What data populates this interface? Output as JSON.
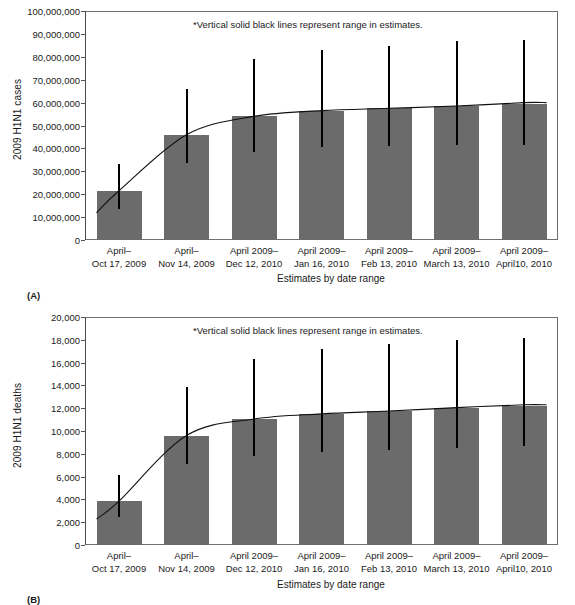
{
  "chart_data": [
    {
      "type": "bar",
      "panel": "(A)",
      "title": "",
      "xlabel": "Estimates by date range",
      "ylabel": "2009 H1N1 cases",
      "annotation": "*Vertical solid black lines represent range in estimates.",
      "ylim": [
        0,
        100000000
      ],
      "ytick_values": [
        0,
        10000000,
        20000000,
        30000000,
        40000000,
        50000000,
        60000000,
        70000000,
        80000000,
        90000000,
        100000000
      ],
      "ytick_labels": [
        "0",
        "10,000,000",
        "20,000,000",
        "30,000,000",
        "40,000,000",
        "50,000,000",
        "60,000,000",
        "70,000,000",
        "80,000,000",
        "90,000,000",
        "100,000,000"
      ],
      "grid": false,
      "legend": "none",
      "categories": [
        [
          "April–",
          "Oct 17, 2009"
        ],
        [
          "April–",
          "Nov 14, 2009"
        ],
        [
          "April 2009–",
          "Dec 12, 2010"
        ],
        [
          "April 2009–",
          "Jan 16, 2010"
        ],
        [
          "April 2009–",
          "Feb 13, 2010"
        ],
        [
          "April 2009–",
          "March 13, 2010"
        ],
        [
          "April 2009–",
          "April10, 2010"
        ]
      ],
      "values": [
        21500000,
        46000000,
        54000000,
        56500000,
        57500000,
        58500000,
        59500000
      ],
      "range_low": [
        13500000,
        33500000,
        38500000,
        40500000,
        41000000,
        41500000,
        41500000
      ],
      "range_high": [
        33000000,
        66000000,
        79000000,
        83000000,
        84500000,
        87000000,
        87500000
      ],
      "trend_values": [
        21500000,
        46000000,
        54000000,
        56500000,
        57500000,
        58500000,
        60000000
      ]
    },
    {
      "type": "bar",
      "panel": "(B)",
      "title": "",
      "xlabel": "Estimates by date range",
      "ylabel": "2009 H1N1 deaths",
      "annotation": "*Vertical solid black lines represent range in estimates.",
      "ylim": [
        0,
        20000
      ],
      "ytick_values": [
        0,
        2000,
        4000,
        6000,
        8000,
        10000,
        12000,
        14000,
        16000,
        18000,
        20000
      ],
      "ytick_labels": [
        "0",
        "2,000",
        "4,000",
        "6,000",
        "8,000",
        "10,000",
        "12,000",
        "14,000",
        "16,000",
        "18,000",
        "20,000"
      ],
      "grid": false,
      "legend": "none",
      "categories": [
        [
          "April–",
          "Oct 17, 2009"
        ],
        [
          "April–",
          "Nov 14, 2009"
        ],
        [
          "April 2009–",
          "Dec 12, 2010"
        ],
        [
          "April 2009–",
          "Jan 16, 2010"
        ],
        [
          "April 2009–",
          "Feb 13, 2010"
        ],
        [
          "April 2009–",
          "March 13, 2010"
        ],
        [
          "April 2009–",
          "April10, 2010"
        ]
      ],
      "values": [
        3850,
        9600,
        11050,
        11500,
        11750,
        12050,
        12200
      ],
      "range_low": [
        2450,
        7100,
        7800,
        8150,
        8300,
        8500,
        8650
      ],
      "range_high": [
        6100,
        13900,
        16300,
        17200,
        17600,
        17950,
        18200
      ],
      "trend_values": [
        3850,
        9600,
        11050,
        11500,
        11750,
        12050,
        12300
      ]
    }
  ],
  "figures": {
    "a": {
      "panel_letter": "(A)",
      "ylabel": "2009 H1N1 cases",
      "xlabel": "Estimates by date range",
      "annotation": "*Vertical solid black lines represent range in estimates."
    },
    "b": {
      "panel_letter": "(B)",
      "ylabel": "2009 H1N1 deaths",
      "xlabel": "Estimates by date range",
      "annotation": "*Vertical solid black lines represent range in estimates."
    }
  },
  "colors": {
    "bar_fill": "#6b6b6b",
    "error_line": "#000000",
    "trend_line": "#111111",
    "axis": "#6f6f6f",
    "text": "#1a1a1a",
    "background": "#ffffff"
  }
}
